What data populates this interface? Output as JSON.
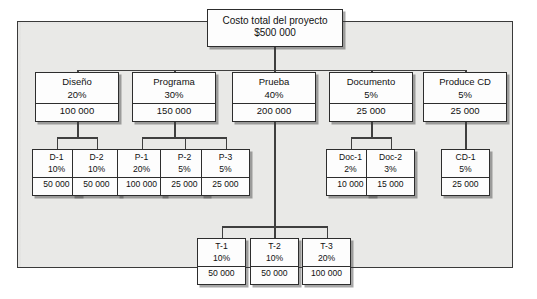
{
  "diagram": {
    "frame_background": "#e9e9e7",
    "box_background": "#fdfdfd",
    "line_color": "#3f3f3f"
  },
  "root": {
    "label": "Costo total del proyecto",
    "amount": "$500 000"
  },
  "level2": [
    {
      "label": "Diseño",
      "percent": "20%",
      "amount": "100 000"
    },
    {
      "label": "Programa",
      "percent": "30%",
      "amount": "150 000"
    },
    {
      "label": "Prueba",
      "percent": "40%",
      "amount": "200 000"
    },
    {
      "label": "Documento",
      "percent": "5%",
      "amount": "25 000"
    },
    {
      "label": "Produce CD",
      "percent": "5%",
      "amount": "25 000"
    }
  ],
  "level3": [
    {
      "label": "D-1",
      "percent": "10%",
      "amount": "50 000"
    },
    {
      "label": "D-2",
      "percent": "10%",
      "amount": "50 000"
    },
    {
      "label": "P-1",
      "percent": "20%",
      "amount": "100 000"
    },
    {
      "label": "P-2",
      "percent": "5%",
      "amount": "25 000"
    },
    {
      "label": "P-3",
      "percent": "5%",
      "amount": "25 000"
    },
    {
      "label": "Doc-1",
      "percent": "2%",
      "amount": "10 000"
    },
    {
      "label": "Doc-2",
      "percent": "3%",
      "amount": "15 000"
    },
    {
      "label": "CD-1",
      "percent": "5%",
      "amount": "25 000"
    }
  ],
  "level4": [
    {
      "label": "T-1",
      "percent": "10%",
      "amount": "50 000"
    },
    {
      "label": "T-2",
      "percent": "10%",
      "amount": "50 000"
    },
    {
      "label": "T-3",
      "percent": "20%",
      "amount": "100 000"
    }
  ]
}
